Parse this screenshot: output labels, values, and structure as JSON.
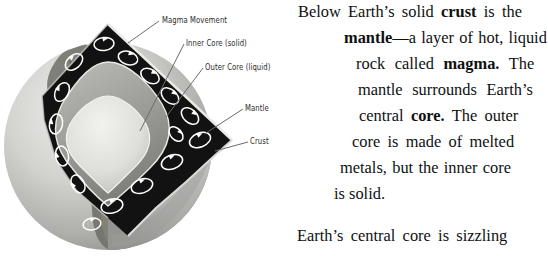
{
  "figure": {
    "name": "earth-cutaway-diagram",
    "colors": {
      "sphere_light": "#d8d8d6",
      "sphere_mid": "#b9b9b6",
      "sphere_shadow": "#8e8e8b",
      "continent": "#6f6f68",
      "mantle_dark": "#121212",
      "outer_core": "#9a9a96",
      "inner_core": "#e2e2de",
      "arrow_white": "#ffffff",
      "leader_line": "#6b6b6b",
      "label_text": "#2b2b2b"
    },
    "labels": [
      {
        "id": "magma-movement",
        "text": "Magma Movement"
      },
      {
        "id": "inner-core",
        "text": "Inner Core (solid)"
      },
      {
        "id": "outer-core",
        "text": "Outer Core (liquid)"
      },
      {
        "id": "mantle",
        "text": "Mantle"
      },
      {
        "id": "crust",
        "text": "Crust"
      }
    ]
  },
  "body_text": {
    "paragraph_1": {
      "full": "Below Earth's solid crust is the mantle—a layer of hot, liquid rock called magma. The mantle surrounds Earth's central core. The outer core is made of melted metals, but the inner core is solid.",
      "lines": [
        {
          "id": "p1-l1",
          "segments": [
            {
              "text": "Below Earth’s solid ",
              "bold": false
            },
            {
              "text": "crust",
              "bold": true
            },
            {
              "text": " is the",
              "bold": false
            }
          ]
        },
        {
          "id": "p1-l2",
          "segments": [
            {
              "text": "mantle",
              "bold": true
            },
            {
              "text": "—a layer of hot, liquid",
              "bold": false
            }
          ]
        },
        {
          "id": "p1-l3",
          "segments": [
            {
              "text": "rock called ",
              "bold": false
            },
            {
              "text": "magma.",
              "bold": true
            },
            {
              "text": " The",
              "bold": false
            }
          ]
        },
        {
          "id": "p1-l4",
          "segments": [
            {
              "text": "mantle surrounds Earth’s",
              "bold": false
            }
          ]
        },
        {
          "id": "p1-l5",
          "segments": [
            {
              "text": "central ",
              "bold": false
            },
            {
              "text": "core.",
              "bold": true
            },
            {
              "text": " The outer",
              "bold": false
            }
          ]
        },
        {
          "id": "p1-l6",
          "segments": [
            {
              "text": "core is made of melted",
              "bold": false
            }
          ]
        },
        {
          "id": "p1-l7",
          "segments": [
            {
              "text": "metals, but the inner core",
              "bold": false
            }
          ]
        },
        {
          "id": "p1-l8",
          "segments": [
            {
              "text": "is solid.",
              "bold": false
            }
          ]
        }
      ]
    },
    "paragraph_2": {
      "full": "Earth's central core is sizzling",
      "lines": [
        {
          "id": "p2-l1",
          "segments": [
            {
              "text": "Earth’s central core is sizzling",
              "bold": false
            }
          ]
        }
      ]
    }
  }
}
